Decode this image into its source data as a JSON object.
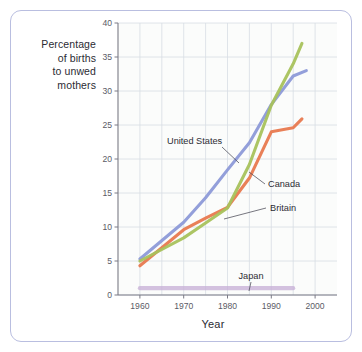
{
  "figure": {
    "frame_color": "#b9bee0",
    "background": "#ffffff"
  },
  "axis_titles": {
    "y_line1": "Percentage",
    "y_line2": "of births",
    "y_line3": "to unwed",
    "y_line4": "mothers",
    "x": "Year"
  },
  "chart_data": {
    "type": "line",
    "title": "",
    "xlabel": "Year",
    "ylabel": "Percentage of births to unwed mothers",
    "xlim": [
      1955,
      2005
    ],
    "ylim": [
      0,
      40
    ],
    "xticks": [
      1960,
      1970,
      1980,
      1990,
      2000
    ],
    "xtick_labels": [
      "1960",
      "1970",
      "1980",
      "1990",
      "2000"
    ],
    "yticks": [
      0,
      5,
      10,
      15,
      20,
      25,
      30,
      35,
      40
    ],
    "ytick_labels": [
      "0",
      "5",
      "10",
      "15",
      "20",
      "25",
      "30",
      "35",
      "40"
    ],
    "x_minor_step": 5,
    "grid": true,
    "grid_color": "#d8dde4",
    "legend": "annotations",
    "legend_position": "inline-callouts",
    "series": [
      {
        "name": "United States",
        "color": "#8d9ad8",
        "x": [
          1960,
          1970,
          1975,
          1980,
          1985,
          1990,
          1995,
          1998
        ],
        "values": [
          5.3,
          10.7,
          14.3,
          18.4,
          22.0,
          28.0,
          32.2,
          33.0
        ]
      },
      {
        "name": "Canada",
        "color": "#e8794f",
        "x": [
          1960,
          1970,
          1975,
          1980,
          1985,
          1990,
          1995,
          1997
        ],
        "values": [
          4.3,
          9.6,
          11.3,
          12.9,
          17.0,
          24.0,
          24.6,
          25.9
        ]
      },
      {
        "name": "Britain",
        "color": "#a9c martial"
      }
    ]
  },
  "annotations": [
    {
      "label": "United States",
      "target_series": "United States"
    },
    {
      "label": "Canada",
      "target_series": "Canada"
    },
    {
      "label": "Britain",
      "target_series": "Britain"
    },
    {
      "label": "Japan",
      "target_series": "Japan"
    }
  ]
}
